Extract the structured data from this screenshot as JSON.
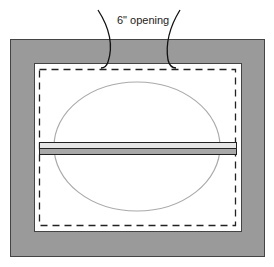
{
  "diagram": {
    "opening_label": "6\" opening",
    "colors": {
      "frame_fill": "#9a9a9a",
      "frame_stroke": "#444444",
      "inner_fill": "#ffffff",
      "dashed_line": "#222222",
      "ellipse": "#aaaaaa",
      "bar_top": "#e6e6e6",
      "bar_bottom": "#a8a8a8",
      "bar_stroke": "#222222"
    }
  }
}
